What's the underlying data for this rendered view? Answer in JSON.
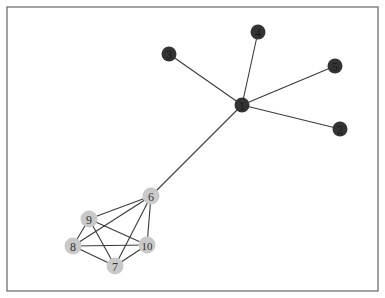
{
  "diagram": {
    "type": "network-graph",
    "frame": {
      "x": 7,
      "y": 7,
      "width": 371,
      "height": 284
    },
    "colors": {
      "dark_node": "#333333",
      "dark_label": "#1a1a1a",
      "light_node": "#c9c9c9",
      "light_label": "#333333",
      "edge": "#3a3a3a"
    },
    "nodes": [
      {
        "id": "1",
        "label": "1",
        "x": 242,
        "y": 105,
        "group": "dark"
      },
      {
        "id": "2",
        "label": "2",
        "x": 340,
        "y": 129,
        "group": "dark"
      },
      {
        "id": "3",
        "label": "3",
        "x": 169,
        "y": 54,
        "group": "dark"
      },
      {
        "id": "4",
        "label": "4",
        "x": 258,
        "y": 32,
        "group": "dark"
      },
      {
        "id": "5",
        "label": "5",
        "x": 335,
        "y": 66,
        "group": "dark"
      },
      {
        "id": "6",
        "label": "6",
        "x": 151,
        "y": 196,
        "group": "light"
      },
      {
        "id": "7",
        "label": "7",
        "x": 115,
        "y": 266,
        "group": "light"
      },
      {
        "id": "8",
        "label": "8",
        "x": 73,
        "y": 246,
        "group": "light"
      },
      {
        "id": "9",
        "label": "9",
        "x": 89,
        "y": 219,
        "group": "light"
      },
      {
        "id": "10",
        "label": "10",
        "x": 147,
        "y": 245,
        "group": "light"
      }
    ],
    "edges": [
      [
        "1",
        "2"
      ],
      [
        "1",
        "3"
      ],
      [
        "1",
        "4"
      ],
      [
        "1",
        "5"
      ],
      [
        "1",
        "6"
      ],
      [
        "6",
        "9"
      ],
      [
        "6",
        "8"
      ],
      [
        "6",
        "7"
      ],
      [
        "6",
        "10"
      ],
      [
        "9",
        "8"
      ],
      [
        "9",
        "10"
      ],
      [
        "9",
        "7"
      ],
      [
        "8",
        "10"
      ],
      [
        "8",
        "7"
      ],
      [
        "7",
        "10"
      ]
    ]
  }
}
